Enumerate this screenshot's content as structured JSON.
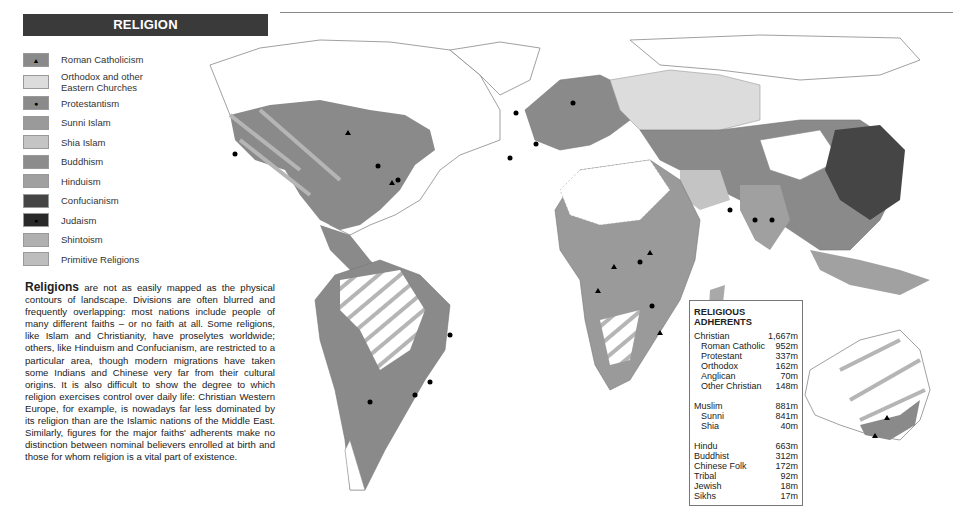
{
  "header": {
    "title": "RELIGION"
  },
  "legend": {
    "items": [
      {
        "label": "Roman Catholicism",
        "color": "#8a8a8a",
        "marker": "triangle"
      },
      {
        "label": "Orthodox and other Eastern Churches",
        "color": "#dcdcdc",
        "marker": ""
      },
      {
        "label": "Protestantism",
        "color": "#8a8a8a",
        "marker": "dot"
      },
      {
        "label": "Sunni Islam",
        "color": "#9a9a9a",
        "marker": ""
      },
      {
        "label": "Shia Islam",
        "color": "#c4c4c4",
        "marker": ""
      },
      {
        "label": "Buddhism",
        "color": "#8c8c8c",
        "marker": ""
      },
      {
        "label": "Hinduism",
        "color": "#a0a0a0",
        "marker": ""
      },
      {
        "label": "Confucianism",
        "color": "#454545",
        "marker": ""
      },
      {
        "label": "Judaism",
        "color": "#2a2a2a",
        "marker": "dot"
      },
      {
        "label": "Shintoism",
        "color": "#b0b0b0",
        "marker": ""
      },
      {
        "label": "Primitive Religions",
        "color": "#bdbdbd",
        "marker": "hatch"
      }
    ]
  },
  "intro": {
    "lead": "Religions",
    "text": " are not as easily mapped as the physical contours of landscape. Divisions are often blurred and frequently overlapping: most nations include people of many different faiths – or no faith at all. Some religions, like Islam and Christianity, have proselytes worldwide; others, like Hinduism and Confucianism, are restricted to a particular area, though modern migrations have taken some Indians and Chinese very far from their cultural origins. It is also difficult to show the degree to which religion exercises control over daily life: Christian Western Europe, for example, is nowadays far less dominated by its religion than are the Islamic nations of the Middle East. Similarly, figures for the major faiths' adherents make no distinction between nominal believers enrolled at birth and those for whom religion is a vital part of existence."
  },
  "adherents": {
    "title": "RELIGIOUS ADHERENTS",
    "groups": [
      {
        "rows": [
          {
            "label": "Christian",
            "value": "1,667m",
            "sub": false
          },
          {
            "label": "Roman Catholic",
            "value": "952m",
            "sub": true
          },
          {
            "label": "Protestant",
            "value": "337m",
            "sub": true
          },
          {
            "label": "Orthodox",
            "value": "162m",
            "sub": true
          },
          {
            "label": "Anglican",
            "value": "70m",
            "sub": true
          },
          {
            "label": "Other Christian",
            "value": "148m",
            "sub": true
          }
        ]
      },
      {
        "rows": [
          {
            "label": "Muslim",
            "value": "881m",
            "sub": false
          },
          {
            "label": "Sunni",
            "value": "841m",
            "sub": true
          },
          {
            "label": "Shia",
            "value": "40m",
            "sub": true
          }
        ]
      },
      {
        "rows": [
          {
            "label": "Hindu",
            "value": "663m",
            "sub": false
          },
          {
            "label": "Buddhist",
            "value": "312m",
            "sub": false
          },
          {
            "label": "Chinese Folk",
            "value": "172m",
            "sub": false
          },
          {
            "label": "Tribal",
            "value": "92m",
            "sub": false
          },
          {
            "label": "Jewish",
            "value": "18m",
            "sub": false
          },
          {
            "label": "Sikhs",
            "value": "17m",
            "sub": false
          }
        ]
      }
    ]
  },
  "map": {
    "label": "World map of religions",
    "land_fill": "#8a8a8a",
    "outline": "#888888"
  }
}
